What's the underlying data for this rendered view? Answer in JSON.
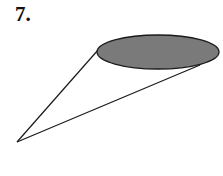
{
  "problem": {
    "number_label": "7."
  },
  "figure": {
    "type": "cone",
    "base_fill": "#7a7a7a",
    "stroke": "#1a1a1a",
    "apex": {
      "x": 17,
      "y": 142
    },
    "base_ellipse": {
      "cx": 158,
      "cy": 52,
      "rx": 61,
      "ry": 17
    },
    "tangent_upper": {
      "x": 98,
      "y": 50
    },
    "tangent_lower": {
      "x": 200,
      "y": 65
    }
  }
}
